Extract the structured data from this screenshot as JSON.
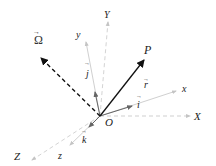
{
  "diagram": {
    "colors": {
      "background": "#ffffff",
      "fixed_axes": "#cccccc",
      "rotating_axes": "#bdbdbd",
      "position_vector": "#111111",
      "omega_vector": "#111111",
      "unit_vectors": "#777777"
    },
    "labels": {
      "origin": "O",
      "point": "P",
      "position_vector": "r",
      "angular_velocity": "Ω",
      "unit_i": "i",
      "unit_j": "j",
      "unit_k": "k",
      "fixed_X": "X",
      "fixed_Y": "Y",
      "fixed_Z": "Z",
      "rot_x": "x",
      "rot_y": "y",
      "rot_z": "z",
      "arrow_accent": "→"
    },
    "nodes": [
      {
        "id": "O",
        "x": 100,
        "y": 116
      },
      {
        "id": "P",
        "x": 145,
        "y": 59
      },
      {
        "id": "Omega_tip",
        "x": 40,
        "y": 57
      },
      {
        "id": "X_end",
        "x": 191,
        "y": 116
      },
      {
        "id": "Y_end",
        "x": 108,
        "y": 20
      },
      {
        "id": "Z_end",
        "x": 30,
        "y": 162
      },
      {
        "id": "x_end",
        "x": 178,
        "y": 90
      },
      {
        "id": "y_end",
        "x": 86,
        "y": 40
      },
      {
        "id": "z_end",
        "x": 70,
        "y": 146
      }
    ],
    "edges": [
      {
        "from": "O",
        "to": "P",
        "style": "solid",
        "label": "r"
      },
      {
        "from": "O",
        "to": "Omega_tip",
        "style": "dashed",
        "label": "Ω"
      },
      {
        "from": "O",
        "to": "X_end",
        "style": "dashed-light",
        "label": "X"
      },
      {
        "from": "O",
        "to": "Y_end",
        "style": "dashed-light",
        "label": "Y"
      },
      {
        "from": "O",
        "to": "Z_end",
        "style": "dashed-light",
        "label": "Z"
      },
      {
        "from": "O",
        "to": "x_end",
        "style": "light",
        "label": "x"
      },
      {
        "from": "O",
        "to": "y_end",
        "style": "light",
        "label": "y"
      },
      {
        "from": "O",
        "to": "z_end",
        "style": "light",
        "label": "z"
      },
      {
        "from": "O",
        "to": "i_tip",
        "style": "unit",
        "label": "i"
      },
      {
        "from": "O",
        "to": "j_tip",
        "style": "unit",
        "label": "j"
      },
      {
        "from": "O",
        "to": "k_tip",
        "style": "unit",
        "label": "k"
      }
    ]
  }
}
